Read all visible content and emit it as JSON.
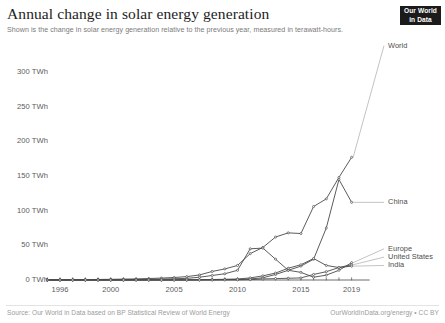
{
  "header": {
    "title": "Annual change in solar energy generation",
    "subtitle": "Shown is the change in solar energy generation relative to the previous year, measured in terawatt-hours."
  },
  "logo": {
    "line1": "Our World",
    "line2": "in Data"
  },
  "footer": {
    "source": "Source: Our World in Data based on BP Statistical Review of World Energy",
    "license": "OurWorldInData.org/energy • CC BY"
  },
  "chart_data": {
    "type": "line",
    "title": "Annual change in solar energy generation",
    "subtitle": "Shown is the change in solar energy generation relative to the previous year, measured in terawatt-hours.",
    "xlabel": "",
    "ylabel": "TWh",
    "xlim": [
      1995,
      2020
    ],
    "ylim": [
      0,
      330
    ],
    "grid": false,
    "legend_position": "right-inline",
    "y_ticks": [
      0,
      50,
      100,
      150,
      200,
      250,
      300
    ],
    "y_tick_labels": [
      "0 TWh",
      "50 TWh",
      "100 TWh",
      "150 TWh",
      "200 TWh",
      "250 TWh",
      "300 TWh"
    ],
    "x_ticks": [
      1996,
      2000,
      2005,
      2010,
      2015,
      2019
    ],
    "x_tick_labels": [
      "1996",
      "2000",
      "2005",
      "2010",
      "2015",
      "2019"
    ],
    "x": [
      1995,
      1996,
      1997,
      1998,
      1999,
      2000,
      2001,
      2002,
      2003,
      2004,
      2005,
      2006,
      2007,
      2008,
      2009,
      2010,
      2011,
      2012,
      2013,
      2014,
      2015,
      2016,
      2017,
      2018,
      2019
    ],
    "series": [
      {
        "name": "World",
        "color": "#4a4a4a",
        "label_y_twh": 338,
        "values": [
          0.3,
          0.4,
          0.5,
          0.6,
          0.8,
          1.0,
          1.3,
          1.6,
          2.1,
          2.8,
          3.6,
          4.9,
          7.3,
          12.3,
          16.0,
          21.0,
          38.0,
          47.0,
          62.0,
          68.0,
          67.0,
          106.0,
          117.0,
          148.0,
          177.0
        ]
      },
      {
        "name": "China",
        "color": "#4a4a4a",
        "label_y_twh": 112,
        "values": [
          0.0,
          0.0,
          0.0,
          0.0,
          0.0,
          0.0,
          0.0,
          0.0,
          0.0,
          0.0,
          0.1,
          0.1,
          0.2,
          0.3,
          0.5,
          0.6,
          1.5,
          3.2,
          8.0,
          14.0,
          20.0,
          30.0,
          75.0,
          145.0,
          112.0
        ]
      },
      {
        "name": "Europe",
        "color": "#4a4a4a",
        "label_y_twh": 45,
        "values": [
          0.1,
          0.1,
          0.2,
          0.2,
          0.3,
          0.4,
          0.5,
          0.7,
          0.9,
          1.3,
          1.8,
          2.4,
          4.0,
          6.5,
          9.0,
          14.0,
          45.0,
          46.0,
          30.0,
          14.0,
          11.0,
          4.0,
          7.0,
          14.0,
          25.0
        ]
      },
      {
        "name": "United States",
        "color": "#4a4a4a",
        "label_y_twh": 33,
        "values": [
          0.0,
          0.0,
          0.0,
          0.0,
          0.0,
          0.0,
          0.0,
          0.1,
          0.1,
          0.1,
          0.2,
          0.3,
          0.4,
          0.7,
          1.0,
          1.5,
          3.0,
          6.0,
          10.0,
          17.0,
          22.0,
          31.0,
          21.0,
          18.0,
          22.0
        ]
      },
      {
        "name": "India",
        "color": "#4a4a4a",
        "label_y_twh": 21,
        "values": [
          0.0,
          0.0,
          0.0,
          0.0,
          0.0,
          0.0,
          0.0,
          0.0,
          0.0,
          0.0,
          0.0,
          0.0,
          0.0,
          0.0,
          0.1,
          0.2,
          0.5,
          1.5,
          2.0,
          2.5,
          3.0,
          8.0,
          12.0,
          18.0,
          20.0
        ]
      }
    ]
  }
}
